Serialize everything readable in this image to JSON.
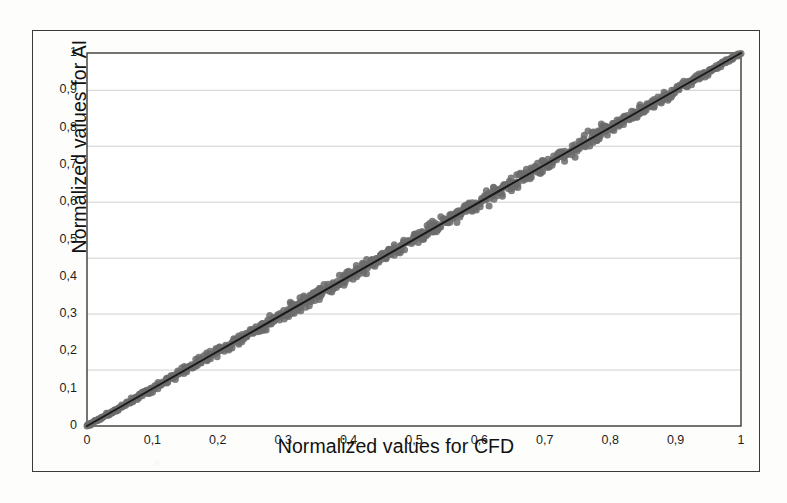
{
  "figure": {
    "background_color": "#fdfdfc",
    "frame_color": "#3a3a3a",
    "has_outer_frame": true
  },
  "chart_data": {
    "type": "scatter",
    "title": "",
    "subtitle": "",
    "xlabel": "Normalized values for CFD",
    "ylabel": "Normalized values for AI",
    "xlim": [
      0,
      1
    ],
    "ylim": [
      0,
      1
    ],
    "grid": true,
    "grid_orientation": "horizontal",
    "grid_color": "#c9c9c9",
    "grid_values": [
      0.15,
      0.3,
      0.45,
      0.6,
      0.75,
      0.9
    ],
    "legend": null,
    "legend_position": "none",
    "x_tick_labels": [
      "0",
      "0,1",
      "0,2",
      "0,3",
      "0,4",
      "0,5",
      "0,6",
      "0,7",
      "0,8",
      "0,9",
      "1"
    ],
    "y_tick_labels": [
      "0",
      "0,1",
      "0,2",
      "0,3",
      "0,4",
      "0,5",
      "0,6",
      "0,7",
      "0,8",
      "0,9",
      "1"
    ],
    "x_tick_values": [
      0,
      0.1,
      0.2,
      0.3,
      0.4,
      0.5,
      0.6,
      0.7,
      0.8,
      0.9,
      1
    ],
    "y_tick_values": [
      0,
      0.1,
      0.2,
      0.3,
      0.4,
      0.5,
      0.6,
      0.7,
      0.8,
      0.9,
      1
    ],
    "decimal_separator": ",",
    "series": [
      {
        "name": "CFD vs AI normalized values",
        "type": "scatter",
        "marker": "circle",
        "marker_color": "#6b6b6b",
        "marker_size": 7,
        "point_count": 900,
        "description": "Dense cloud of points lying along the identity line y=x, band narrow near the origin and near (1,1), slightly wider through the mid and upper range.",
        "x": [
          0.004,
          0.012,
          0.021,
          0.029,
          0.034,
          0.041,
          0.047,
          0.052,
          0.058,
          0.063,
          0.069,
          0.074,
          0.079,
          0.084,
          0.09,
          0.095,
          0.101,
          0.106,
          0.112,
          0.117,
          0.123,
          0.128,
          0.134,
          0.139,
          0.145,
          0.15,
          0.156,
          0.161,
          0.167,
          0.172,
          0.178,
          0.183,
          0.189,
          0.194,
          0.2,
          0.205,
          0.211,
          0.216,
          0.222,
          0.227,
          0.233,
          0.238,
          0.244,
          0.249,
          0.255,
          0.26,
          0.266,
          0.271,
          0.277,
          0.282,
          0.288,
          0.293,
          0.299,
          0.304,
          0.31,
          0.315,
          0.321,
          0.326,
          0.332,
          0.337,
          0.343,
          0.348,
          0.354,
          0.359,
          0.365,
          0.37,
          0.376,
          0.381,
          0.387,
          0.392,
          0.398,
          0.403,
          0.409,
          0.414,
          0.42,
          0.425,
          0.431,
          0.436,
          0.442,
          0.447,
          0.453,
          0.458,
          0.464,
          0.469,
          0.475,
          0.48,
          0.486,
          0.491,
          0.497,
          0.502,
          0.508,
          0.513,
          0.519,
          0.524,
          0.53,
          0.535,
          0.541,
          0.546,
          0.552,
          0.557,
          0.563,
          0.568,
          0.574,
          0.579,
          0.585,
          0.59,
          0.596,
          0.601,
          0.607,
          0.612,
          0.618,
          0.623,
          0.629,
          0.634,
          0.64,
          0.645,
          0.651,
          0.656,
          0.662,
          0.667,
          0.673,
          0.678,
          0.684,
          0.689,
          0.695,
          0.7,
          0.706,
          0.711,
          0.717,
          0.722,
          0.728,
          0.733,
          0.739,
          0.744,
          0.75,
          0.755,
          0.761,
          0.766,
          0.772,
          0.777,
          0.783,
          0.788,
          0.794,
          0.799,
          0.805,
          0.81,
          0.816,
          0.821,
          0.827,
          0.832,
          0.838,
          0.843,
          0.849,
          0.854,
          0.86,
          0.865,
          0.871,
          0.876,
          0.882,
          0.887,
          0.893,
          0.898,
          0.904,
          0.909,
          0.915,
          0.92,
          0.926,
          0.931,
          0.937,
          0.942,
          0.948,
          0.953,
          0.959,
          0.964,
          0.97,
          0.975,
          0.981,
          0.986,
          0.992,
          0.997
        ],
        "y_trend": "y ≈ x",
        "band_half_width_at": {
          "0": 0.004,
          "0.2": 0.022,
          "0.5": 0.026,
          "0.75": 0.03,
          "1": 0.008
        }
      },
      {
        "name": "Identity / regression line",
        "type": "line",
        "line_color": "#1a1a1a",
        "line_width": 2,
        "x": [
          0,
          1
        ],
        "y": [
          0,
          1
        ]
      }
    ]
  }
}
